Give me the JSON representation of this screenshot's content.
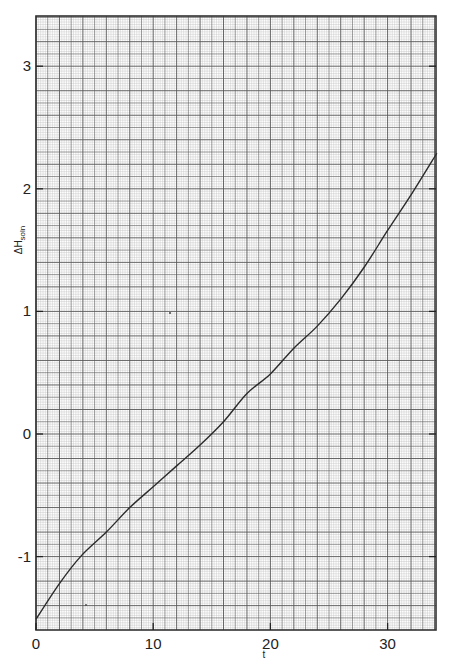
{
  "chart_data": {
    "type": "line",
    "title": "",
    "xlabel": "t",
    "ylabel": "ΔH",
    "ylabel_subscript": "soln",
    "xlim": [
      0,
      34.2
    ],
    "ylim": [
      -1.6,
      3.4
    ],
    "xticks": [
      0,
      10,
      20,
      30
    ],
    "xtick_labels": [
      "0",
      "10",
      "20",
      "30"
    ],
    "yticks": [
      -1,
      0,
      1,
      2,
      3
    ],
    "ytick_labels": [
      "-1",
      "0",
      "1",
      "2",
      "3"
    ],
    "grid": "graph-paper (fine minor + major lines)",
    "legend": null,
    "series": [
      {
        "name": "ΔHsoln",
        "x": [
          0,
          2,
          3.8,
          6,
          8,
          10,
          12,
          14,
          16,
          18,
          20,
          22,
          24,
          26,
          28,
          30,
          32,
          34.2
        ],
        "values": [
          -1.51,
          -1.22,
          -1.0,
          -0.8,
          -0.6,
          -0.43,
          -0.26,
          -0.09,
          0.1,
          0.33,
          0.49,
          0.7,
          0.88,
          1.1,
          1.36,
          1.66,
          1.95,
          2.29
        ]
      }
    ]
  },
  "colors": {
    "background": "#ffffff",
    "grid_minor": "#bdbdbd",
    "grid_major": "#555555",
    "frame": "#333333",
    "curve": "#2b2b2b"
  }
}
